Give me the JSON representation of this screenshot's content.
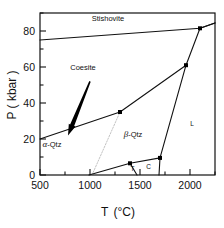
{
  "figure": {
    "name": "silica-phase-diagram"
  },
  "axes": {
    "x": {
      "label_main": "T",
      "label_unit": "(°C)",
      "ticks": [
        500,
        1000,
        1500,
        2000
      ],
      "tick_labels": [
        "500",
        "1000",
        "1500",
        "2000"
      ],
      "min": 500,
      "max": 2250,
      "minor_step": 250
    },
    "y": {
      "label": "P ( kbar )",
      "ticks": [
        0,
        20,
        40,
        60,
        80
      ],
      "tick_labels": [
        "0",
        "20",
        "40",
        "60",
        "80"
      ],
      "min": 0,
      "max": 90,
      "minor_step": 10
    }
  },
  "phase_labels": [
    {
      "id": "stishovite",
      "text": "Stishovite",
      "x": 1180,
      "y": 85.5
    },
    {
      "id": "coesite",
      "text": "Coesite",
      "x": 930,
      "y": 58.5
    },
    {
      "id": "alpha-quartz",
      "text": "-Qtz",
      "greek": "α",
      "x": 620,
      "y": 15.5
    },
    {
      "id": "beta-quartz",
      "text": "-Qtz",
      "greek": "β",
      "x": 1430,
      "y": 21.0
    },
    {
      "id": "liquid",
      "text": "L",
      "x": 2020,
      "y": 27.0
    },
    {
      "id": "cristobalite",
      "text": "C",
      "x": 1585,
      "y": 3.2
    },
    {
      "id": "tridymite",
      "text": "T",
      "x": 1425,
      "y": 2.4
    }
  ],
  "chart_data": {
    "type": "line",
    "title": "",
    "xlabel": "T (°C)",
    "ylabel": "P ( kbar )",
    "xlim": [
      500,
      2250
    ],
    "ylim": [
      0,
      90
    ],
    "grid": false,
    "legend": "none",
    "series": [
      {
        "name": "coesite-stishovite boundary",
        "style": "solid",
        "points": [
          [
            500,
            75.0
          ],
          [
            1350,
            78.5
          ],
          [
            2100,
            81.5
          ],
          [
            2250,
            84.5
          ]
        ]
      },
      {
        "name": "quartz-coesite boundary",
        "style": "solid",
        "points": [
          [
            500,
            20.0
          ],
          [
            1300,
            35.0
          ],
          [
            1960,
            61.0
          ],
          [
            2100,
            81.5
          ]
        ]
      },
      {
        "name": "alpha-beta quartz transition",
        "style": "dotted",
        "points": [
          [
            1020,
            0.0
          ],
          [
            1300,
            35.0
          ]
        ]
      },
      {
        "name": "melting curve lower",
        "style": "solid",
        "points": [
          [
            990,
            0.0
          ],
          [
            1400,
            6.5
          ],
          [
            1700,
            9.5
          ]
        ]
      },
      {
        "name": "beta-quartz liquidus",
        "style": "solid",
        "points": [
          [
            1700,
            9.5
          ],
          [
            1960,
            61.0
          ]
        ]
      },
      {
        "name": "cristobalite-liquid boundary",
        "style": "solid",
        "points": [
          [
            1700,
            9.5
          ],
          [
            1690,
            0.0
          ]
        ]
      },
      {
        "name": "tridymite-cristobalite boundary",
        "style": "solid",
        "points": [
          [
            1400,
            6.5
          ],
          [
            1470,
            0.0
          ]
        ]
      },
      {
        "name": "liquidus upper",
        "style": "solid",
        "points": [
          [
            2100,
            81.5
          ],
          [
            2250,
            84.5
          ]
        ]
      }
    ],
    "markers": [
      {
        "x": 1300,
        "y": 35.0
      },
      {
        "x": 1960,
        "y": 61.0
      },
      {
        "x": 2100,
        "y": 81.5
      },
      {
        "x": 1400,
        "y": 6.5
      },
      {
        "x": 1700,
        "y": 9.5
      }
    ],
    "annotations": [
      {
        "id": "coesite-pointer-arrow",
        "type": "arrow",
        "from": [
          1000,
          52
        ],
        "to": [
          780,
          22
        ],
        "color": "#000000"
      }
    ]
  }
}
